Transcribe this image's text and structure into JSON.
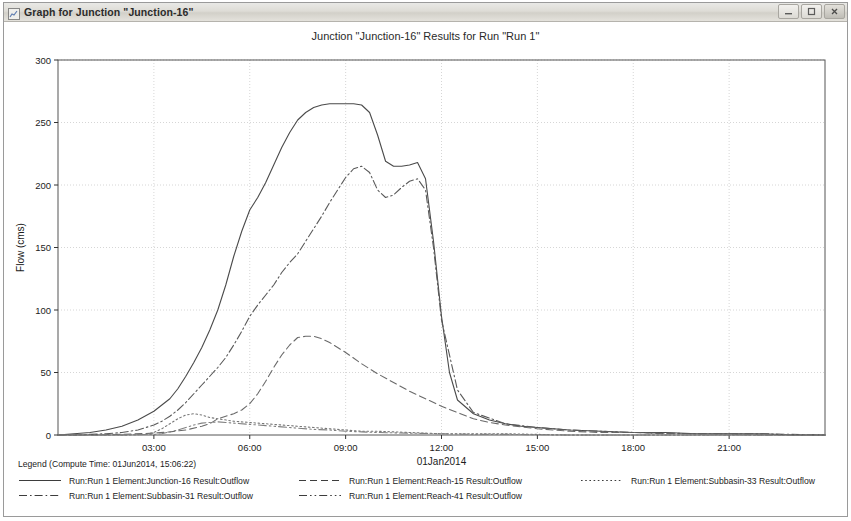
{
  "window": {
    "title": "Graph for Junction \"Junction-16\"",
    "app_icon": "graph-window-icon",
    "buttons": {
      "minimize": "Minimize",
      "maximize": "Maximize",
      "close": "Close"
    }
  },
  "chart_data": {
    "type": "line",
    "title": "Junction \"Junction-16\" Results for Run \"Run 1\"",
    "xlabel": "01Jan2014",
    "ylabel": "Flow (cms)",
    "ylim": [
      0,
      300
    ],
    "yticks": [
      0,
      50,
      100,
      150,
      200,
      250,
      300
    ],
    "ytick_labels": [
      "0",
      "50",
      "100",
      "150",
      "200",
      "250",
      "300"
    ],
    "xlim_hours": [
      0,
      24
    ],
    "xticks_hours": [
      3,
      6,
      9,
      12,
      15,
      18,
      21
    ],
    "xtick_labels": [
      "03:00",
      "06:00",
      "09:00",
      "12:00",
      "15:00",
      "18:00",
      "21:00"
    ],
    "grid": true,
    "legend_position": "below-plot",
    "legend_title": "Legend (Compute Time: 01Jun2014, 15:06:22)",
    "series": [
      {
        "name": "Run:Run 1 Element:Junction-16 Result:Outflow",
        "style": "solid",
        "color": "#4a4a4a",
        "x": [
          0,
          0.5,
          1,
          1.5,
          2,
          2.5,
          3,
          3.25,
          3.5,
          3.75,
          4,
          4.25,
          4.5,
          4.75,
          5,
          5.25,
          5.5,
          5.75,
          6,
          6.25,
          6.5,
          6.75,
          7,
          7.25,
          7.5,
          7.75,
          8,
          8.25,
          8.5,
          8.75,
          9,
          9.25,
          9.5,
          9.75,
          10,
          10.25,
          10.5,
          10.75,
          11,
          11.25,
          11.5,
          11.75,
          12,
          12.25,
          12.5,
          13,
          13.5,
          14,
          14.5,
          15,
          16,
          17,
          18,
          19,
          20,
          21,
          22,
          23,
          24
        ],
        "y": [
          0,
          1,
          2,
          4,
          7,
          12,
          19,
          24,
          29,
          37,
          47,
          58,
          70,
          84,
          100,
          120,
          143,
          163,
          180,
          190,
          202,
          216,
          230,
          242,
          252,
          258,
          262,
          264,
          265,
          265,
          265,
          265,
          264,
          258,
          240,
          219,
          215,
          215,
          216,
          218,
          205,
          155,
          95,
          50,
          28,
          17,
          12,
          9,
          7,
          6,
          4,
          3,
          2,
          2,
          1,
          1,
          1,
          0,
          0
        ]
      },
      {
        "name": "Run:Run 1 Element:Reach-15 Result:Outflow",
        "style": "dashed",
        "color": "#6a6a6a",
        "x": [
          0,
          1,
          2,
          3,
          3.5,
          4,
          4.5,
          4.75,
          5,
          5.25,
          5.5,
          5.75,
          6,
          6.25,
          6.5,
          6.75,
          7,
          7.25,
          7.5,
          7.75,
          8,
          8.25,
          8.5,
          8.75,
          9,
          9.5,
          10,
          10.5,
          11,
          11.5,
          12,
          12.5,
          13,
          13.5,
          14,
          15,
          16,
          17,
          18,
          19,
          20,
          21,
          22,
          23,
          24
        ],
        "y": [
          0,
          0,
          0.5,
          1.5,
          2.5,
          4,
          7,
          9,
          13,
          15,
          17,
          20,
          25,
          33,
          43,
          54,
          64,
          72,
          78,
          79,
          79,
          77,
          74,
          70,
          66,
          57,
          49,
          42,
          35,
          29,
          23,
          18,
          13,
          10,
          8,
          5,
          3,
          2,
          2,
          1,
          1,
          1,
          0,
          0,
          0
        ]
      },
      {
        "name": "Run:Run 1 Element:Subbasin-33 Result:Outflow",
        "style": "dotted",
        "color": "#777777",
        "x": [
          0,
          1,
          2,
          2.75,
          3,
          3.25,
          3.5,
          3.75,
          4,
          4.25,
          4.5,
          4.75,
          5,
          5.5,
          6,
          6.5,
          7,
          7.5,
          8,
          8.5,
          9,
          9.5,
          10,
          11,
          12,
          14,
          16,
          18,
          20,
          22,
          24
        ],
        "y": [
          0,
          0,
          0,
          0.5,
          2,
          5,
          9,
          13,
          16,
          17,
          16,
          14,
          13,
          11,
          10,
          9,
          8,
          7,
          6,
          5,
          4,
          3,
          3,
          2,
          1,
          1,
          0,
          0,
          0,
          0,
          0
        ]
      },
      {
        "name": "Run:Run 1 Element:Subbasin-31 Result:Outflow",
        "style": "dashdot",
        "color": "#5a5a5a",
        "x": [
          0,
          0.5,
          1,
          1.5,
          2,
          2.5,
          3,
          3.25,
          3.5,
          3.75,
          4,
          4.25,
          4.5,
          4.75,
          5,
          5.25,
          5.5,
          5.75,
          6,
          6.25,
          6.5,
          6.75,
          7,
          7.25,
          7.5,
          7.75,
          8,
          8.25,
          8.5,
          8.75,
          9,
          9.25,
          9.5,
          9.75,
          10,
          10.25,
          10.5,
          10.75,
          11,
          11.25,
          11.5,
          11.75,
          12,
          12.5,
          13,
          14,
          15,
          16,
          18,
          20,
          22,
          24
        ],
        "y": [
          0,
          0,
          0.5,
          1,
          2,
          4,
          8,
          11,
          15,
          20,
          26,
          33,
          40,
          47,
          54,
          62,
          72,
          83,
          95,
          104,
          112,
          120,
          130,
          138,
          145,
          155,
          165,
          175,
          186,
          196,
          206,
          213,
          215,
          210,
          196,
          190,
          192,
          198,
          203,
          205,
          196,
          150,
          92,
          36,
          18,
          9,
          6,
          4,
          2,
          1,
          1,
          0
        ]
      },
      {
        "name": "Run:Run 1 Element:Reach-41 Result:Outflow",
        "style": "dashdotdot",
        "color": "#808080",
        "x": [
          0,
          1,
          2,
          3,
          3.25,
          3.5,
          3.75,
          4,
          4.25,
          4.5,
          4.75,
          5,
          5.25,
          5.5,
          6,
          6.5,
          7,
          7.5,
          8,
          8.5,
          9,
          9.5,
          10,
          11,
          12,
          13,
          14,
          16,
          18,
          20,
          22,
          24
        ],
        "y": [
          0,
          0,
          0,
          0.5,
          1,
          2.5,
          4,
          6,
          8,
          9.5,
          10,
          10.5,
          10,
          9.5,
          8.5,
          7.5,
          6.5,
          5.5,
          4.5,
          4,
          3,
          2.5,
          2,
          1.5,
          1,
          0.5,
          0.5,
          0,
          0,
          0,
          0,
          0
        ]
      }
    ]
  },
  "legend": {
    "title": "Legend (Compute Time: 01Jun2014, 15:06:22)",
    "columns": [
      [
        {
          "label": "Run:Run 1 Element:Junction-16 Result:Outflow",
          "style": "solid"
        },
        {
          "label": "Run:Run 1 Element:Subbasin-31 Result:Outflow",
          "style": "dashdot"
        }
      ],
      [
        {
          "label": "Run:Run 1 Element:Reach-15 Result:Outflow",
          "style": "dashed"
        },
        {
          "label": "Run:Run 1 Element:Reach-41 Result:Outflow",
          "style": "dashdotdot"
        }
      ],
      [
        {
          "label": "Run:Run 1 Element:Subbasin-33 Result:Outflow",
          "style": "dotted"
        }
      ]
    ]
  }
}
